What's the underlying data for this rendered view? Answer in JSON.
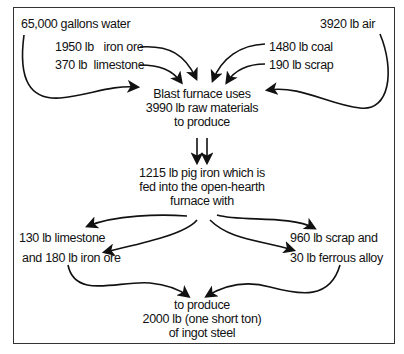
{
  "diagram": {
    "type": "flow",
    "title": "",
    "blast_furnace_inputs": [
      {
        "id": "water",
        "label": "65,000 gallons water"
      },
      {
        "id": "iron_ore",
        "label": "1950 lb   iron ore"
      },
      {
        "id": "limestone",
        "label": "370 lb  limestone"
      },
      {
        "id": "air",
        "label": "3920 lb air"
      },
      {
        "id": "coal",
        "label": "1480 lb coal"
      },
      {
        "id": "scrap",
        "label": "190 lb scrap"
      }
    ],
    "blast_furnace": {
      "lines": [
        "Blast furnace uses",
        "3990 lb raw materials",
        "to produce"
      ]
    },
    "pig_iron": {
      "lines": [
        "1215 lb pig iron which is",
        "fed into the open-hearth",
        "furnace with"
      ]
    },
    "open_hearth_inputs": [
      {
        "id": "oh_limestone",
        "label": "130 lb limestone"
      },
      {
        "id": "oh_iron_ore",
        "label": "and 180 lb iron ore"
      },
      {
        "id": "oh_scrap",
        "label": "960 lb scrap and"
      },
      {
        "id": "ferrous_alloy",
        "label": "30 lb ferrous alloy"
      }
    ],
    "output": {
      "lines": [
        "to produce",
        "2000 lb (one short ton)",
        "of ingot steel"
      ]
    },
    "colors": {
      "line": "#111111",
      "frame": "#333333",
      "background": "#ffffff"
    }
  }
}
